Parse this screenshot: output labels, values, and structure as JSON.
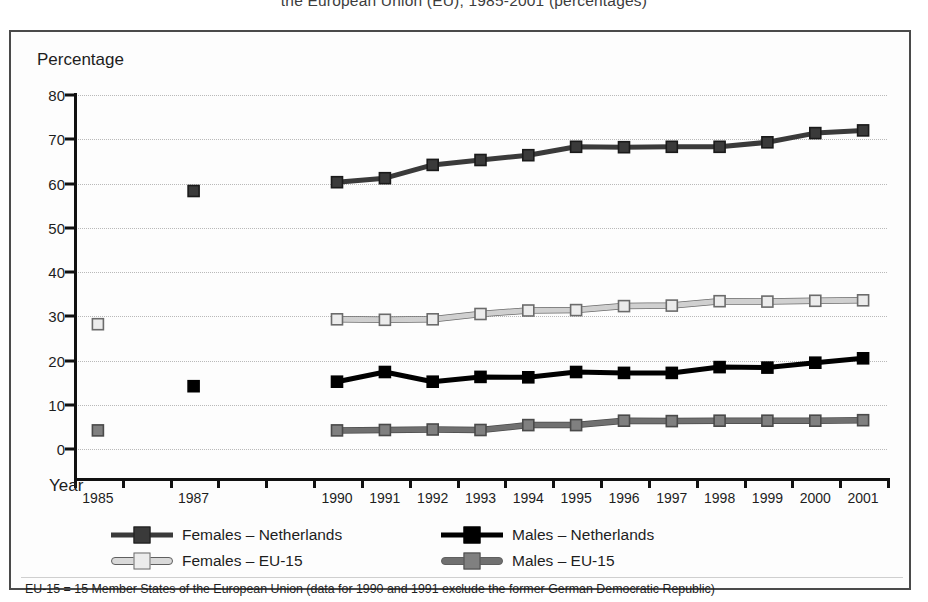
{
  "title": "the European Union (EU), 1985-2001 (percentages)",
  "axes": {
    "y_axis_title": "Percentage",
    "x_axis_title": "Year"
  },
  "footnote": "EU-15 = 15 Member States of the European Union (data for 1990 and 1991 exclude the former German Democratic Republic)",
  "legend": {
    "entries": [
      {
        "label": "Females – Netherlands",
        "color": "#3a3a3a",
        "marker": "filled-square-dark"
      },
      {
        "label": "Males – Netherlands",
        "color": "#000000",
        "marker": "filled-square-black"
      },
      {
        "label": "Females – EU-15",
        "color": "#d9d9d9",
        "marker": "open-square-light"
      },
      {
        "label": "Males – EU-15",
        "color": "#707070",
        "marker": "filled-square-grey"
      }
    ]
  },
  "chart_data": {
    "type": "line",
    "title": "the European Union (EU), 1985-2001 (percentages)",
    "xlabel": "Year",
    "ylabel": "Percentage",
    "ylim": [
      0,
      80
    ],
    "ytick_step": 10,
    "yticks": [
      0,
      10,
      20,
      30,
      40,
      50,
      60,
      70,
      80
    ],
    "grid": true,
    "legend_position": "bottom",
    "x": [
      1985,
      1986,
      1987,
      1988,
      1989,
      1990,
      1991,
      1992,
      1993,
      1994,
      1995,
      1996,
      1997,
      1998,
      1999,
      2000,
      2001
    ],
    "xtick_labels": [
      "1985",
      "",
      "1987",
      "",
      "",
      "1990",
      "1991",
      "1992",
      "1993",
      "1994",
      "1995",
      "1996",
      "1997",
      "1998",
      "1999",
      "2000",
      "2001"
    ],
    "series": [
      {
        "name": "Females – Netherlands",
        "color": "#3a3a3a",
        "marker_fill": "#3a3a3a",
        "marker_edge": "#1a1a1a",
        "values": [
          null,
          null,
          58.3,
          null,
          null,
          60.3,
          61.2,
          64.2,
          65.3,
          66.4,
          68.3,
          68.2,
          68.3,
          68.3,
          69.3,
          71.4,
          72.0
        ]
      },
      {
        "name": "Males – Netherlands",
        "color": "#000000",
        "marker_fill": "#000000",
        "marker_edge": "#000000",
        "values": [
          null,
          null,
          14.2,
          null,
          null,
          15.2,
          17.4,
          15.2,
          16.3,
          16.2,
          17.4,
          17.2,
          17.2,
          18.5,
          18.4,
          19.5,
          20.5
        ]
      },
      {
        "name": "Females – EU-15",
        "color": "#d9d9d9",
        "marker_fill": "#ececec",
        "marker_edge": "#6b6b6b",
        "values": [
          28.2,
          null,
          null,
          null,
          null,
          29.3,
          29.2,
          29.3,
          30.5,
          31.3,
          31.4,
          32.3,
          32.4,
          33.4,
          33.3,
          33.5,
          33.6
        ]
      },
      {
        "name": "Males – EU-15",
        "color": "#707070",
        "marker_fill": "#808080",
        "marker_edge": "#4a4a4a",
        "values": [
          4.2,
          null,
          null,
          null,
          null,
          4.2,
          4.3,
          4.4,
          4.3,
          5.4,
          5.4,
          6.4,
          6.3,
          6.4,
          6.4,
          6.4,
          6.5
        ]
      }
    ]
  }
}
